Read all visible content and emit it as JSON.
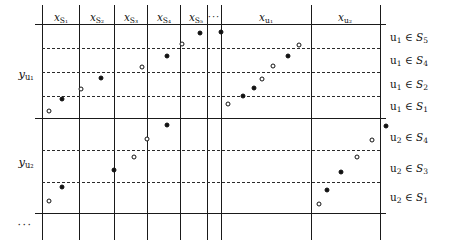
{
  "figure": {
    "type": "schematic-grid-scatter",
    "width": 456,
    "height": 243,
    "colors": {
      "line": "#1a1a1a",
      "dashed": "#2b2b2b",
      "marker_filled": "#111111",
      "marker_open_fill": "#ffffff",
      "background": "#ffffff"
    }
  },
  "column_headers": [
    {
      "id": "x-s1",
      "base": "x",
      "sub": "S₁",
      "text": "x S1",
      "cx": 61,
      "y": 12
    },
    {
      "id": "x-s2",
      "base": "x",
      "sub": "S₂",
      "text": "x S2",
      "cx": 97,
      "y": 12
    },
    {
      "id": "x-s3",
      "base": "x",
      "sub": "S₃",
      "text": "x S3",
      "cx": 131,
      "y": 12
    },
    {
      "id": "x-s4",
      "base": "x",
      "sub": "S₄",
      "text": "x S4",
      "cx": 164,
      "y": 12
    },
    {
      "id": "x-s5",
      "base": "x",
      "sub": "S₅",
      "text": "x S5",
      "cx": 196,
      "y": 12
    },
    {
      "id": "x-dots",
      "base": "···",
      "sub": "",
      "text": "...",
      "cx": 214,
      "y": 12
    },
    {
      "id": "x-u1",
      "base": "x",
      "sub": "u₁",
      "text": "x u1",
      "cx": 266,
      "y": 12
    },
    {
      "id": "x-u2",
      "base": "x",
      "sub": "u₂",
      "text": "x u2",
      "cx": 345,
      "y": 12
    }
  ],
  "row_headers": [
    {
      "id": "y-u1",
      "base": "y",
      "sub": "u₁",
      "text": "y u1",
      "cx": 26,
      "cy": 75
    },
    {
      "id": "y-u2",
      "base": "y",
      "sub": "u₂",
      "text": "y u2",
      "cx": 26,
      "cy": 163
    },
    {
      "id": "y-dots",
      "base": "···",
      "sub": "",
      "text": "...",
      "cx": 25,
      "cy": 225
    }
  ],
  "side_labels": [
    {
      "id": "u1-s5",
      "text": "u₁ ∈ S₅",
      "var": "u",
      "vsub": "1",
      "set": "S",
      "ssub": "5",
      "y": 38
    },
    {
      "id": "u1-s4",
      "text": "u₁ ∈ S₄",
      "var": "u",
      "vsub": "1",
      "set": "S",
      "ssub": "4",
      "y": 61
    },
    {
      "id": "u1-s2",
      "text": "u₁ ∈ S₂",
      "var": "u",
      "vsub": "1",
      "set": "S",
      "ssub": "2",
      "y": 85
    },
    {
      "id": "u1-s1",
      "text": "u₁ ∈ S₁",
      "var": "u",
      "vsub": "1",
      "set": "S",
      "ssub": "1",
      "y": 107
    },
    {
      "id": "u2-s4",
      "text": "u₂ ∈ S₄",
      "var": "u",
      "vsub": "2",
      "set": "S",
      "ssub": "4",
      "y": 138
    },
    {
      "id": "u2-s3",
      "text": "u₂ ∈ S₃",
      "var": "u",
      "vsub": "2",
      "set": "S",
      "ssub": "3",
      "y": 169
    },
    {
      "id": "u2-s1",
      "text": "u₂ ∈ S₁",
      "var": "u",
      "vsub": "2",
      "set": "S",
      "ssub": "1",
      "y": 198
    }
  ],
  "vertical_lines": [
    {
      "x": 42,
      "y1": 5,
      "y2": 240,
      "weight": "normal"
    },
    {
      "x": 79,
      "y1": 5,
      "y2": 240,
      "weight": "normal"
    },
    {
      "x": 114,
      "y1": 5,
      "y2": 240,
      "weight": "normal"
    },
    {
      "x": 147,
      "y1": 5,
      "y2": 240,
      "weight": "normal"
    },
    {
      "x": 180,
      "y1": 5,
      "y2": 240,
      "weight": "normal"
    },
    {
      "x": 207,
      "y1": 5,
      "y2": 240,
      "weight": "normal"
    },
    {
      "x": 221,
      "y1": 5,
      "y2": 240,
      "weight": "normal"
    },
    {
      "x": 311,
      "y1": 5,
      "y2": 240,
      "weight": "normal"
    },
    {
      "x": 380,
      "y1": 5,
      "y2": 240,
      "weight": "normal"
    }
  ],
  "horizontal_lines": [
    {
      "y": 24,
      "x1": 35,
      "x2": 386
    },
    {
      "y": 118,
      "x1": 35,
      "x2": 386
    },
    {
      "y": 213,
      "x1": 35,
      "x2": 386
    }
  ],
  "dashed_lines": [
    {
      "y": 48,
      "x1": 42,
      "x2": 380
    },
    {
      "y": 72,
      "x1": 42,
      "x2": 380
    },
    {
      "y": 96,
      "x1": 42,
      "x2": 380
    },
    {
      "y": 150,
      "x1": 42,
      "x2": 380
    },
    {
      "y": 182,
      "x1": 42,
      "x2": 380
    }
  ],
  "markers": [
    {
      "x": 49,
      "y": 111,
      "style": "open"
    },
    {
      "x": 62,
      "y": 99,
      "style": "filled"
    },
    {
      "x": 81,
      "y": 89,
      "style": "open"
    },
    {
      "x": 101,
      "y": 78,
      "style": "filled"
    },
    {
      "x": 142,
      "y": 67,
      "style": "open"
    },
    {
      "x": 167,
      "y": 56,
      "style": "filled"
    },
    {
      "x": 182,
      "y": 44,
      "style": "open"
    },
    {
      "x": 200,
      "y": 33,
      "style": "filled"
    },
    {
      "x": 221,
      "y": 32,
      "style": "filled"
    },
    {
      "x": 228,
      "y": 104,
      "style": "open"
    },
    {
      "x": 243,
      "y": 96,
      "style": "filled"
    },
    {
      "x": 254,
      "y": 88,
      "style": "filled"
    },
    {
      "x": 262,
      "y": 79,
      "style": "open"
    },
    {
      "x": 273,
      "y": 66,
      "style": "open"
    },
    {
      "x": 288,
      "y": 56,
      "style": "filled"
    },
    {
      "x": 299,
      "y": 45,
      "style": "open"
    },
    {
      "x": 49,
      "y": 201,
      "style": "open"
    },
    {
      "x": 62,
      "y": 187,
      "style": "filled"
    },
    {
      "x": 114,
      "y": 170,
      "style": "filled"
    },
    {
      "x": 134,
      "y": 157,
      "style": "open"
    },
    {
      "x": 147,
      "y": 139,
      "style": "open"
    },
    {
      "x": 167,
      "y": 125,
      "style": "filled"
    },
    {
      "x": 319,
      "y": 204,
      "style": "open"
    },
    {
      "x": 327,
      "y": 190,
      "style": "filled"
    },
    {
      "x": 341,
      "y": 172,
      "style": "filled"
    },
    {
      "x": 357,
      "y": 157,
      "style": "open"
    },
    {
      "x": 372,
      "y": 140,
      "style": "open"
    },
    {
      "x": 386,
      "y": 126,
      "style": "filled"
    }
  ]
}
